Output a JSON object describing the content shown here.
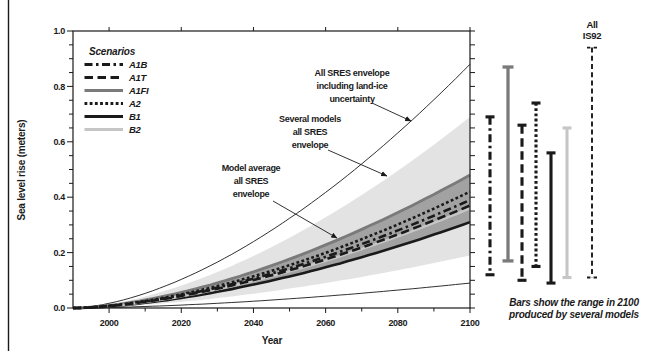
{
  "page": {
    "background": "#ffffff",
    "border_color": "#1a1a1a"
  },
  "chart_data": {
    "type": "area",
    "title": "",
    "xlabel": "Year",
    "ylabel": "Sea level rise (meters)",
    "x_range": [
      1990,
      2100
    ],
    "y_range": [
      0.0,
      1.0
    ],
    "grid": false,
    "legend_position": "upper-left-inside",
    "shape_exponent": 1.65,
    "x_major_tick_years": [
      2000,
      2020,
      2040,
      2060,
      2080,
      2100
    ],
    "x_major_tick_labels": [
      "2000",
      "2020",
      "2040",
      "2060",
      "2080",
      "2100"
    ],
    "x_minor_tick_years": [
      2010,
      2030,
      2050,
      2070,
      2090
    ],
    "y_major_tick_values": [
      0.0,
      0.2,
      0.4,
      0.6,
      0.8,
      1.0
    ],
    "y_major_tick_labels": [
      "0.0",
      "0.2",
      "0.4",
      "0.6",
      "0.8",
      "1.0"
    ],
    "y_minor_step": 0.05,
    "envelopes": [
      {
        "id": "all-sres-including-land-ice-uncertainty",
        "label": "All SRES envelope including land-ice uncertainty",
        "top_2100": 0.88,
        "bottom_2100": 0.09,
        "fill": "none",
        "stroke": "#1a1a1a",
        "stroke_width": 0.9
      },
      {
        "id": "several-models-all-sres",
        "label": "Several models all SRES envelope",
        "top_2100": 0.69,
        "bottom_2100": 0.19,
        "fill": "#e3e3e3"
      },
      {
        "id": "model-average-all-sres",
        "label": "Model average all SRES envelope",
        "top_2100": 0.48,
        "bottom_2100": 0.31,
        "fill": "#a2a2a2"
      }
    ],
    "scenarios": [
      {
        "name": "A1B",
        "model_average_2100": 0.39,
        "range_2100": [
          0.12,
          0.69
        ],
        "color": "#1a1a1a",
        "dash": "8 3.5 2.5 3.5",
        "width": 2.6
      },
      {
        "name": "A1T",
        "model_average_2100": 0.37,
        "range_2100": [
          0.1,
          0.66
        ],
        "color": "#1a1a1a",
        "dash": "8.5 4.5",
        "width": 2.6
      },
      {
        "name": "A1FI",
        "model_average_2100": 0.48,
        "range_2100": [
          0.17,
          0.87
        ],
        "color": "#7a7a7a",
        "dash": "",
        "width": 2.8
      },
      {
        "name": "A2",
        "model_average_2100": 0.42,
        "range_2100": [
          0.15,
          0.74
        ],
        "color": "#1a1a1a",
        "dash": "2.8 2.4",
        "width": 2.6
      },
      {
        "name": "B1",
        "model_average_2100": 0.31,
        "range_2100": [
          0.09,
          0.56
        ],
        "color": "#1a1a1a",
        "dash": "",
        "width": 2.6
      },
      {
        "name": "B2",
        "model_average_2100": 0.36,
        "range_2100": [
          0.11,
          0.65
        ],
        "color": "#c6c6c6",
        "dash": "",
        "width": 2.6
      }
    ],
    "is92": {
      "name": "All IS92",
      "label_lines": [
        "All",
        "IS92"
      ],
      "range_2100": [
        0.11,
        0.94
      ],
      "color": "#1a1a1a",
      "dash": "5 3.2",
      "width": 1.4
    },
    "bar_order": [
      "A1B",
      "A1FI",
      "A1T",
      "A2",
      "B1",
      "B2",
      "IS92"
    ],
    "legend": {
      "title": "Scenarios"
    },
    "annotations": [
      {
        "id": "all-sres-envelope-including-land-ice-uncertainty",
        "lines": [
          "All SRES envelope",
          "including land-ice",
          "uncertainty"
        ],
        "cx": 352,
        "line_baselines": [
          76,
          89,
          102
        ],
        "arrow": [
          372,
          103,
          411,
          121
        ]
      },
      {
        "id": "several-models-all-sres-envelope",
        "lines": [
          "Several models",
          "all SRES",
          "envelope"
        ],
        "cx": 310,
        "line_baselines": [
          122,
          135,
          148
        ],
        "arrow": [
          328,
          150,
          387,
          176
        ]
      },
      {
        "id": "model-average-all-sres-envelope",
        "lines": [
          "Model average",
          "all SRES",
          "envelope"
        ],
        "cx": 251,
        "line_baselines": [
          171,
          184,
          197
        ],
        "arrow": [
          273,
          201,
          337,
          238
        ]
      }
    ],
    "caption_lines": [
      "Bars show the range in 2100",
      "produced by several models"
    ]
  }
}
